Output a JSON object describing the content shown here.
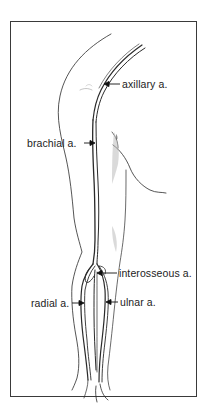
{
  "figure": {
    "border_color": "#3a3a3a",
    "line_color": "#2a2a2a",
    "shade_color": "#bdbdbd"
  },
  "labels": {
    "axillary": "axillary a.",
    "brachial": "brachial a.",
    "interosseous": "interosseous a.",
    "radial": "radial a.",
    "ulnar": "ulnar a."
  }
}
